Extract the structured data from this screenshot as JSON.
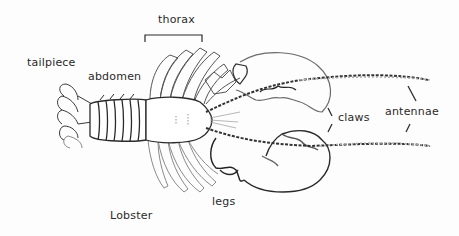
{
  "diagram": {
    "title": "Lobster",
    "labels": [
      {
        "id": "thorax",
        "text": "thorax"
      },
      {
        "id": "tailpiece",
        "text": "tailpiece"
      },
      {
        "id": "abdomen",
        "text": "abdomen"
      },
      {
        "id": "claws",
        "text": "claws"
      },
      {
        "id": "antennae",
        "text": "antennae"
      },
      {
        "id": "legs",
        "text": "legs"
      }
    ],
    "colors": {
      "line": "#2a2a2a",
      "light_line": "#9a9a9a",
      "background": "#fdfdfd"
    }
  }
}
